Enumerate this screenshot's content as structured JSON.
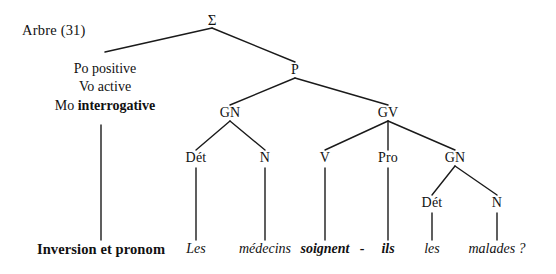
{
  "figure": {
    "caption": "Arbre (31)",
    "caption_x": 22,
    "caption_y": 30,
    "bottom_label": "Inversion et pronom",
    "bottom_label_x": 101,
    "bottom_label_y": 249
  },
  "features": {
    "x": 105,
    "y": 60,
    "rows": [
      {
        "name": "Po",
        "value": "positive",
        "bold": false
      },
      {
        "name": "Vo",
        "value": "active",
        "bold": false
      },
      {
        "name": "Mo",
        "value": "interrogative",
        "bold": true
      }
    ]
  },
  "nodes": [
    {
      "id": "sigma",
      "label": "Σ",
      "x": 212,
      "y": 20,
      "kind": "sigma"
    },
    {
      "id": "p",
      "label": "P",
      "x": 295,
      "y": 70,
      "kind": "cat"
    },
    {
      "id": "gn1",
      "label": "GN",
      "x": 230,
      "y": 113,
      "kind": "cat"
    },
    {
      "id": "gv",
      "label": "GV",
      "x": 388,
      "y": 113,
      "kind": "cat"
    },
    {
      "id": "det1",
      "label": "Dét",
      "x": 196,
      "y": 158,
      "kind": "cat"
    },
    {
      "id": "n1",
      "label": "N",
      "x": 265,
      "y": 158,
      "kind": "cat"
    },
    {
      "id": "v",
      "label": "V",
      "x": 325,
      "y": 158,
      "kind": "cat"
    },
    {
      "id": "pro",
      "label": "Pro",
      "x": 388,
      "y": 158,
      "kind": "cat"
    },
    {
      "id": "gn2",
      "label": "GN",
      "x": 455,
      "y": 158,
      "kind": "cat"
    },
    {
      "id": "det2",
      "label": "Dét",
      "x": 432,
      "y": 203,
      "kind": "cat"
    },
    {
      "id": "n2",
      "label": "N",
      "x": 497,
      "y": 203,
      "kind": "cat"
    }
  ],
  "terminals": [
    {
      "id": "t-les1",
      "text": "Les",
      "x": 196,
      "y": 249,
      "style": "italic"
    },
    {
      "id": "t-medecins",
      "text": "médecins",
      "x": 265,
      "y": 249,
      "style": "italic"
    },
    {
      "id": "t-soignent",
      "text": "soignent",
      "x": 325,
      "y": 249,
      "style": "bold-italic"
    },
    {
      "id": "t-hyphen",
      "text": "-",
      "x": 362,
      "y": 249,
      "style": "bold-plain"
    },
    {
      "id": "t-ils",
      "text": "ils",
      "x": 388,
      "y": 249,
      "style": "bold-italic"
    },
    {
      "id": "t-les2",
      "text": "les",
      "x": 432,
      "y": 249,
      "style": "italic"
    },
    {
      "id": "t-malades",
      "text": "malades ?",
      "x": 497,
      "y": 249,
      "style": "italic"
    }
  ],
  "edges": [
    {
      "id": "e-sigma-feat",
      "x1": 212,
      "y1": 28,
      "x2": 105,
      "y2": 52
    },
    {
      "id": "e-sigma-p",
      "x1": 212,
      "y1": 28,
      "x2": 295,
      "y2": 62
    },
    {
      "id": "e-feat-stem",
      "x1": 101,
      "y1": 125,
      "x2": 101,
      "y2": 240
    },
    {
      "id": "e-p-gn1",
      "x1": 295,
      "y1": 78,
      "x2": 230,
      "y2": 105
    },
    {
      "id": "e-p-gv",
      "x1": 295,
      "y1": 78,
      "x2": 388,
      "y2": 105
    },
    {
      "id": "e-gn1-det1",
      "x1": 230,
      "y1": 121,
      "x2": 196,
      "y2": 150
    },
    {
      "id": "e-gn1-n1",
      "x1": 230,
      "y1": 121,
      "x2": 265,
      "y2": 150
    },
    {
      "id": "e-gv-v",
      "x1": 388,
      "y1": 121,
      "x2": 325,
      "y2": 150
    },
    {
      "id": "e-gv-pro",
      "x1": 388,
      "y1": 121,
      "x2": 388,
      "y2": 150
    },
    {
      "id": "e-gv-gn2",
      "x1": 388,
      "y1": 121,
      "x2": 455,
      "y2": 150
    },
    {
      "id": "e-gn2-det2",
      "x1": 455,
      "y1": 166,
      "x2": 432,
      "y2": 195
    },
    {
      "id": "e-gn2-n2",
      "x1": 455,
      "y1": 166,
      "x2": 497,
      "y2": 195
    },
    {
      "id": "e-det1-les1",
      "x1": 196,
      "y1": 168,
      "x2": 196,
      "y2": 240
    },
    {
      "id": "e-n1-medecins",
      "x1": 265,
      "y1": 168,
      "x2": 265,
      "y2": 240
    },
    {
      "id": "e-v-soignent",
      "x1": 325,
      "y1": 168,
      "x2": 325,
      "y2": 240
    },
    {
      "id": "e-pro-ils",
      "x1": 388,
      "y1": 168,
      "x2": 388,
      "y2": 240
    },
    {
      "id": "e-det2-les2",
      "x1": 432,
      "y1": 213,
      "x2": 432,
      "y2": 240
    },
    {
      "id": "e-n2-malades",
      "x1": 497,
      "y1": 213,
      "x2": 497,
      "y2": 240
    }
  ],
  "colors": {
    "background": "#ffffff",
    "ink": "#111111",
    "line": "#1a1a1a"
  }
}
